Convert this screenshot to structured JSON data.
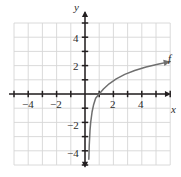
{
  "figure": {
    "width": 181,
    "height": 177,
    "background_color": "#ffffff",
    "grid_color": "#d6d6d6",
    "axis_color": "#231f20",
    "curve_color": "#6f6f6f",
    "text_color": "#2b2b2b"
  },
  "axes": {
    "x_axis_label": "x",
    "y_axis_label": "y",
    "x_tick_labels": [
      "−4",
      "−2",
      "2",
      "4"
    ],
    "y_tick_labels": [
      "4",
      "2",
      "−2",
      "−4"
    ],
    "x_tick_values": [
      -4,
      -2,
      2,
      4
    ],
    "y_tick_values": [
      4,
      2,
      -2,
      -4
    ],
    "x_range": [
      -5.4,
      6.1
    ],
    "y_range": [
      -5.2,
      5.9
    ],
    "grid": "on",
    "grid_step": 1,
    "origin_px": {
      "x": 85,
      "y": 94
    },
    "unit_px": 14.2,
    "x_arrows": [
      "right"
    ],
    "y_arrows": [
      "up",
      "down"
    ]
  },
  "curve": {
    "label": "f",
    "label_position": {
      "x": 168,
      "y": 58
    },
    "arrow_end": "right",
    "asymptote_x": 0.25
  },
  "chart_data": {
    "type": "line",
    "title": "",
    "xlabel": "x",
    "ylabel": "y",
    "xlim": [
      -5.4,
      6.1
    ],
    "ylim": [
      -5.2,
      5.9
    ],
    "grid": true,
    "legend": "none",
    "series": [
      {
        "name": "f",
        "description": "logarithmic curve with vertical asymptote near x = 0.25, x-intercept at x = 1",
        "x": [
          0.27,
          0.3,
          0.35,
          0.4,
          0.5,
          0.6,
          0.75,
          1.0,
          1.3,
          1.7,
          2.2,
          2.8,
          3.5,
          4.3,
          5.2,
          6.0
        ],
        "y": [
          -4.6,
          -3.6,
          -2.6,
          -2.0,
          -1.25,
          -0.78,
          -0.3,
          0.0,
          0.35,
          0.72,
          1.07,
          1.38,
          1.65,
          1.9,
          2.12,
          2.28
        ]
      }
    ],
    "annotations": [
      {
        "text": "f",
        "x": 6.0,
        "y": 2.55
      }
    ]
  }
}
